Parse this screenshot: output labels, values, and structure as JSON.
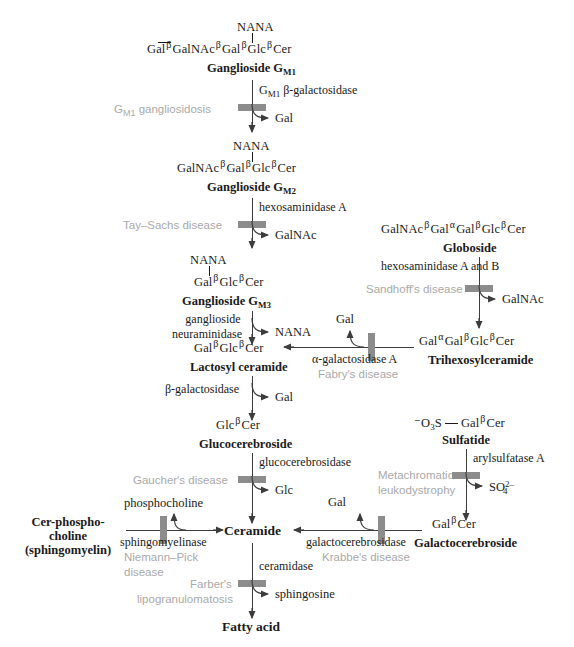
{
  "diagram": {
    "colors": {
      "ink": "#1a1a1a",
      "line": "#3c3c3c",
      "disease_text": "#a9a9a9",
      "blocker_bar": "#8c8c8c",
      "background": "#ffffff"
    }
  },
  "molecules": {
    "gm1": {
      "residues": [
        "Gal",
        "GalNAc",
        "Gal",
        "Glc",
        "Cer"
      ],
      "bonds": [
        "β",
        "β",
        "β",
        "β"
      ],
      "branch": "NANA",
      "branch_index": 2,
      "name": "Ganglioside G",
      "name_sub": "M1"
    },
    "gm2": {
      "residues": [
        "GalNAc",
        "Gal",
        "Glc",
        "Cer"
      ],
      "bonds": [
        "β",
        "β",
        "β"
      ],
      "branch": "NANA",
      "branch_index": 1,
      "name": "Ganglioside G",
      "name_sub": "M2"
    },
    "gm3": {
      "residues": [
        "Gal",
        "Glc",
        "Cer"
      ],
      "bonds": [
        "β",
        "β"
      ],
      "branch": "NANA",
      "branch_index": 0,
      "name": "Ganglioside G",
      "name_sub": "M3"
    },
    "lactosyl_ceramide": {
      "residues": [
        "Gal",
        "Glc",
        "Cer"
      ],
      "bonds": [
        "β",
        "β"
      ],
      "name": "Lactosyl ceramide"
    },
    "glucocerebroside": {
      "residues": [
        "Glc",
        "Cer"
      ],
      "bonds": [
        "β"
      ],
      "name": "Glucocerebroside"
    },
    "globoside": {
      "residues": [
        "GalNAc",
        "Gal",
        "Gal",
        "Glc",
        "Cer"
      ],
      "bonds": [
        "β",
        "α",
        "β",
        "β"
      ],
      "name": "Globoside"
    },
    "trihexosylceramide": {
      "residues": [
        "Gal",
        "Gal",
        "Glc",
        "Cer"
      ],
      "bonds": [
        "α",
        "β",
        "β"
      ],
      "name": "Trihexosylceramide"
    },
    "sulfatide": {
      "prefix": "⁻O",
      "prefix_sub": "3",
      "prefix_tail": "S",
      "residues": [
        "Gal",
        "Cer"
      ],
      "bonds": [
        "β"
      ],
      "name": "Sulfatide"
    },
    "galactocerebroside": {
      "residues": [
        "Gal",
        "Cer"
      ],
      "bonds": [
        "β"
      ],
      "name": "Galactocerebroside"
    },
    "sphingomyelin": {
      "name_line1": "Cer-phospho-",
      "name_line2": "choline",
      "name_line3": "(sphingomyelin)"
    },
    "ceramide": {
      "name": "Ceramide"
    },
    "fatty_acid": {
      "name": "Fatty acid"
    }
  },
  "steps": [
    {
      "id": "gm1-to-gm2",
      "enzyme": "G",
      "enzyme_sub": "M1",
      "enzyme_tail": " β-galactosidase",
      "disease": "G",
      "disease_sub": "M1",
      "disease_tail": " gangliosidosis",
      "product": "Gal"
    },
    {
      "id": "gm2-to-gm3",
      "enzyme": "hexosaminidase A",
      "disease": "Tay–Sachs disease",
      "product": "GalNAc"
    },
    {
      "id": "gm3-to-lactosyl",
      "enzyme_line1": "ganglioside",
      "enzyme_line2": "neuraminidase",
      "product": "NANA"
    },
    {
      "id": "lactosyl-to-gluco",
      "enzyme": "β-galactosidase",
      "product": "Gal"
    },
    {
      "id": "gluco-to-ceramide",
      "enzyme": "glucocerebrosidase",
      "disease": "Gaucher's disease",
      "product": "Glc"
    },
    {
      "id": "globoside-to-trihexosyl",
      "enzyme": "hexosaminidase A and B",
      "disease": "Sandhoff's disease",
      "product": "GalNAc"
    },
    {
      "id": "trihexosyl-to-lactosyl",
      "enzyme": "α-galactosidase A",
      "disease": "Fabry's disease",
      "product": "Gal"
    },
    {
      "id": "sulfatide-to-galactocerebroside",
      "enzyme": "arylsulfatase A",
      "disease_line1": "Metachromatic",
      "disease_line2": "leukodystrophy",
      "product": "SO",
      "product_sub": "4",
      "product_sup": "2–"
    },
    {
      "id": "galactocerebroside-to-ceramide",
      "enzyme": "galactocerebrosidase",
      "disease": "Krabbe's disease",
      "product": "Gal"
    },
    {
      "id": "sphingomyelin-to-ceramide",
      "enzyme": "sphingomyelinase",
      "disease_line1": "Niemann–Pick",
      "disease_line2": "disease",
      "product": "phosphocholine"
    },
    {
      "id": "ceramide-to-fattyacid",
      "enzyme": "ceramidase",
      "disease_line1": "Farber's",
      "disease_line2": "lipogranulomatosis",
      "product": "sphingosine"
    }
  ]
}
